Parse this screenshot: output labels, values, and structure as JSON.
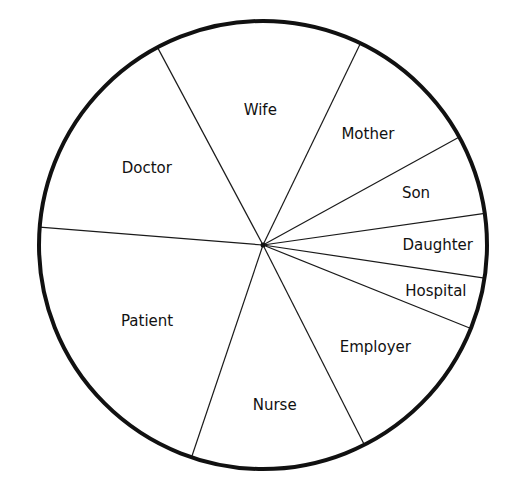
{
  "chart_data": {
    "type": "pie",
    "title": "",
    "start_angle_deg": 241.9,
    "direction": "clockwise",
    "slices": [
      {
        "label": "Wife",
        "degrees": 53.9,
        "percent": 15.0
      },
      {
        "label": "Mother",
        "degrees": 35.4,
        "percent": 9.8
      },
      {
        "label": "Son",
        "degrees": 20.7,
        "percent": 5.8
      },
      {
        "label": "Daughter",
        "degrees": 16.6,
        "percent": 4.6
      },
      {
        "label": "Hospital",
        "degrees": 13.4,
        "percent": 3.7
      },
      {
        "label": "Employer",
        "degrees": 41.2,
        "percent": 11.4
      },
      {
        "label": "Nurse",
        "degrees": 45.5,
        "percent": 12.6
      },
      {
        "label": "Patient",
        "degrees": 76.0,
        "percent": 21.1
      },
      {
        "label": "Doctor",
        "degrees": 57.3,
        "percent": 15.9
      }
    ],
    "legend": "none",
    "labels_inside": true
  },
  "colors": {
    "line": "#111111",
    "background": "#ffffff"
  }
}
